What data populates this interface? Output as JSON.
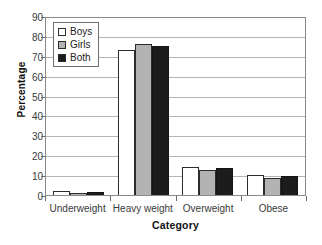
{
  "chart_data": {
    "type": "bar",
    "title": "",
    "xlabel": "Category",
    "ylabel": "Percentage",
    "categories": [
      "Underweight",
      "Heavy weight",
      "Overweight",
      "Obese"
    ],
    "series": [
      {
        "name": "Boys",
        "color": "#ffffff",
        "values": [
          2,
          73.5,
          14,
          10
        ]
      },
      {
        "name": "Girls",
        "color": "#b3b3b3",
        "values": [
          1,
          77,
          12.5,
          8.5
        ]
      },
      {
        "name": "Both",
        "color": "#1c1c1c",
        "values": [
          1.5,
          76,
          13.5,
          9.5
        ]
      }
    ],
    "ylim": [
      0,
      90
    ],
    "yticks": [
      0,
      10,
      20,
      30,
      40,
      50,
      60,
      70,
      80,
      90
    ],
    "ytick_labels": [
      "0",
      "10",
      "20",
      "30",
      "40",
      "50",
      "60",
      "70",
      "80",
      "90"
    ],
    "grid": "horizontal",
    "legend_position": "top-left",
    "legend_entries": [
      "Boys",
      "Girls",
      "Both"
    ]
  }
}
